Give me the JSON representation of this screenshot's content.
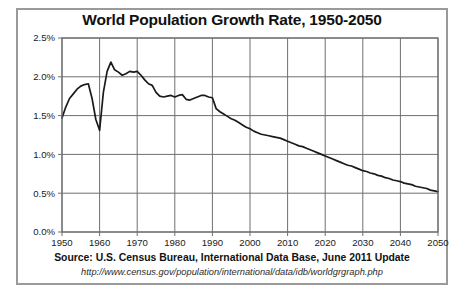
{
  "figure": {
    "title": "World Population Growth Rate, 1950-2050",
    "source_note": "Source: U.S. Census Bureau, International Data Base, June 2011 Update",
    "source_url": "http://www.census.gov/population/international/data/idb/worldgrgraph.php",
    "border_color": "#9a9a9a",
    "background_color": "#ffffff",
    "line_color": "#1a1a1a",
    "grid_color": "#6f6f6f"
  },
  "chart_data": {
    "type": "line",
    "title": "World Population Growth Rate, 1950-2050",
    "xlabel": "",
    "ylabel": "",
    "xlim": [
      1950,
      2050
    ],
    "ylim": [
      0.0,
      2.5
    ],
    "grid": true,
    "legend": "none",
    "y_tick_labels": [
      "0.0%",
      "0.5%",
      "1.0%",
      "1.5%",
      "2.0%",
      "2.5%"
    ],
    "y_ticks": [
      0.0,
      0.5,
      1.0,
      1.5,
      2.0,
      2.5
    ],
    "x_tick_labels": [
      "1950",
      "1960",
      "1970",
      "1980",
      "1990",
      "2000",
      "2010",
      "2020",
      "2030",
      "2040",
      "2050"
    ],
    "x_ticks": [
      1950,
      1960,
      1970,
      1980,
      1990,
      2000,
      2010,
      2020,
      2030,
      2040,
      2050
    ],
    "y_unit": "percent",
    "series": [
      {
        "name": "World population growth rate",
        "x": [
          1950,
          1951,
          1952,
          1953,
          1954,
          1955,
          1956,
          1957,
          1958,
          1959,
          1960,
          1961,
          1962,
          1963,
          1964,
          1965,
          1966,
          1967,
          1968,
          1969,
          1970,
          1971,
          1972,
          1973,
          1974,
          1975,
          1976,
          1977,
          1978,
          1979,
          1980,
          1981,
          1982,
          1983,
          1984,
          1985,
          1986,
          1987,
          1988,
          1989,
          1990,
          1991,
          1992,
          1993,
          1994,
          1995,
          1996,
          1997,
          1998,
          1999,
          2000,
          2001,
          2002,
          2003,
          2004,
          2005,
          2006,
          2007,
          2008,
          2009,
          2010,
          2011,
          2012,
          2013,
          2014,
          2015,
          2016,
          2017,
          2018,
          2019,
          2020,
          2021,
          2022,
          2023,
          2024,
          2025,
          2026,
          2027,
          2028,
          2029,
          2030,
          2031,
          2032,
          2033,
          2034,
          2035,
          2036,
          2037,
          2038,
          2039,
          2040,
          2041,
          2042,
          2043,
          2044,
          2045,
          2046,
          2047,
          2048,
          2049,
          2050
        ],
        "values": [
          1.47,
          1.61,
          1.72,
          1.78,
          1.84,
          1.88,
          1.9,
          1.91,
          1.72,
          1.45,
          1.31,
          1.8,
          2.07,
          2.19,
          2.09,
          2.06,
          2.02,
          2.04,
          2.07,
          2.06,
          2.07,
          2.02,
          1.96,
          1.91,
          1.89,
          1.8,
          1.75,
          1.74,
          1.75,
          1.76,
          1.74,
          1.76,
          1.77,
          1.71,
          1.7,
          1.72,
          1.74,
          1.76,
          1.76,
          1.74,
          1.73,
          1.59,
          1.55,
          1.52,
          1.49,
          1.46,
          1.44,
          1.41,
          1.38,
          1.35,
          1.33,
          1.3,
          1.28,
          1.26,
          1.25,
          1.24,
          1.23,
          1.22,
          1.21,
          1.19,
          1.17,
          1.15,
          1.13,
          1.11,
          1.1,
          1.08,
          1.06,
          1.04,
          1.02,
          1.0,
          0.98,
          0.96,
          0.94,
          0.92,
          0.9,
          0.88,
          0.86,
          0.85,
          0.83,
          0.81,
          0.79,
          0.78,
          0.76,
          0.75,
          0.73,
          0.72,
          0.7,
          0.69,
          0.67,
          0.66,
          0.65,
          0.63,
          0.62,
          0.61,
          0.59,
          0.58,
          0.57,
          0.56,
          0.54,
          0.53,
          0.52
        ]
      }
    ]
  }
}
